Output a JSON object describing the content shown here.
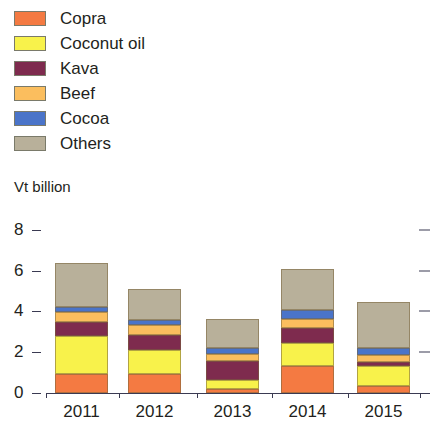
{
  "chart_data": {
    "type": "bar",
    "stacked": true,
    "title": "",
    "subtitle": "",
    "xlabel": "",
    "ylabel": "Vt billion",
    "categories": [
      "2011",
      "2012",
      "2013",
      "2014",
      "2015"
    ],
    "ylim": [
      0,
      8
    ],
    "yticks": [
      0,
      2,
      4,
      6,
      8
    ],
    "ytick_labels": [
      "0",
      "2",
      "4",
      "6",
      "8"
    ],
    "grid": false,
    "legend_position": "top-left",
    "series": [
      {
        "name": "Copra",
        "color": "#F47A42",
        "values": [
          0.95,
          0.93,
          0.21,
          1.34,
          0.36
        ]
      },
      {
        "name": "Coconut oil",
        "color": "#F8F24B",
        "values": [
          1.83,
          1.19,
          0.43,
          1.11,
          0.98
        ]
      },
      {
        "name": "Kava",
        "color": "#7E2B4E",
        "values": [
          0.69,
          0.7,
          0.95,
          0.75,
          0.2
        ]
      },
      {
        "name": "Beef",
        "color": "#FBBE5E",
        "values": [
          0.49,
          0.52,
          0.33,
          0.43,
          0.32
        ]
      },
      {
        "name": "Cocoa",
        "color": "#4A74C9",
        "values": [
          0.26,
          0.26,
          0.29,
          0.42,
          0.33
        ]
      },
      {
        "name": "Others",
        "color": "#B8B09A",
        "values": [
          2.15,
          1.5,
          1.4,
          2.03,
          2.28
        ]
      }
    ],
    "totals": [
      6.0,
      5.1,
      3.6,
      6.1,
      4.3
    ]
  },
  "legend": {
    "items": [
      {
        "label": "Copra",
        "swatch_name": "legend-swatch-copra"
      },
      {
        "label": "Coconut oil",
        "swatch_name": "legend-swatch-coconut-oil"
      },
      {
        "label": "Kava",
        "swatch_name": "legend-swatch-kava"
      },
      {
        "label": "Beef",
        "swatch_name": "legend-swatch-beef"
      },
      {
        "label": "Cocoa",
        "swatch_name": "legend-swatch-cocoa"
      },
      {
        "label": "Others",
        "swatch_name": "legend-swatch-others"
      }
    ]
  },
  "axis": {
    "y_title": "Vt billion"
  }
}
